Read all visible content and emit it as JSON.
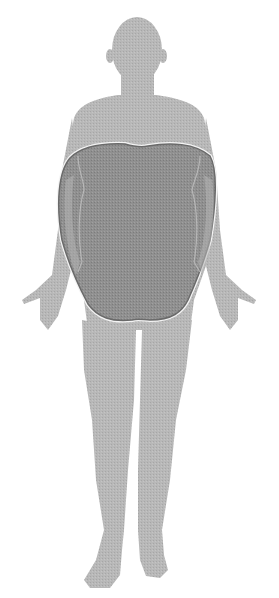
{
  "figure": {
    "overlay": "apple-shaped body fat distribution",
    "colors": {
      "background": "#ffffff",
      "silhouette": "#b4b4b4",
      "overlay_fill": "#8e8e8e",
      "overlay_stroke": "#6a6a6a",
      "overlay_highlight": "#f4f4f4",
      "inner_contour": "#c8c8c8"
    }
  }
}
